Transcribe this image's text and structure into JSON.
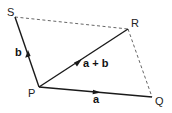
{
  "diagram": {
    "type": "vector-parallelogram",
    "points": {
      "S": {
        "label": "S",
        "x": 15,
        "y": 17
      },
      "R": {
        "label": "R",
        "x": 128,
        "y": 29
      },
      "P": {
        "label": "P",
        "x": 39,
        "y": 87
      },
      "Q": {
        "label": "Q",
        "x": 152,
        "y": 97
      }
    },
    "vectors": [
      {
        "from": "P",
        "to": "S",
        "label": "b",
        "style": "solid"
      },
      {
        "from": "P",
        "to": "R",
        "label": "a + b",
        "style": "solid"
      },
      {
        "from": "P",
        "to": "Q",
        "label": "a",
        "style": "solid"
      }
    ],
    "edges": [
      {
        "from": "S",
        "to": "R",
        "style": "dashed"
      },
      {
        "from": "R",
        "to": "Q",
        "style": "dashed"
      }
    ],
    "labels": {
      "S": "S",
      "R": "R",
      "P": "P",
      "Q": "Q",
      "b": "b",
      "a_plus_b": "a + b",
      "a": "a"
    },
    "colors": {
      "line": "#1a1a1a",
      "dashed": "#555555",
      "background": "#ffffff"
    }
  }
}
